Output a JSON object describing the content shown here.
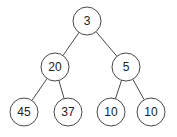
{
  "diagram": {
    "type": "binary-tree",
    "nodes": [
      {
        "id": "n0",
        "label": "3",
        "cx": 87,
        "cy": 21
      },
      {
        "id": "n1",
        "label": "20",
        "cx": 55,
        "cy": 67
      },
      {
        "id": "n2",
        "label": "5",
        "cx": 126,
        "cy": 67
      },
      {
        "id": "n3",
        "label": "45",
        "cx": 24,
        "cy": 112
      },
      {
        "id": "n4",
        "label": "37",
        "cx": 68,
        "cy": 112
      },
      {
        "id": "n5",
        "label": "10",
        "cx": 111,
        "cy": 112
      },
      {
        "id": "n6",
        "label": "10",
        "cx": 151,
        "cy": 112
      }
    ],
    "edges": [
      [
        "n0",
        "n1"
      ],
      [
        "n0",
        "n2"
      ],
      [
        "n1",
        "n3"
      ],
      [
        "n1",
        "n4"
      ],
      [
        "n2",
        "n5"
      ],
      [
        "n2",
        "n6"
      ]
    ],
    "node_radius": 14,
    "stroke_color": "#333333"
  }
}
